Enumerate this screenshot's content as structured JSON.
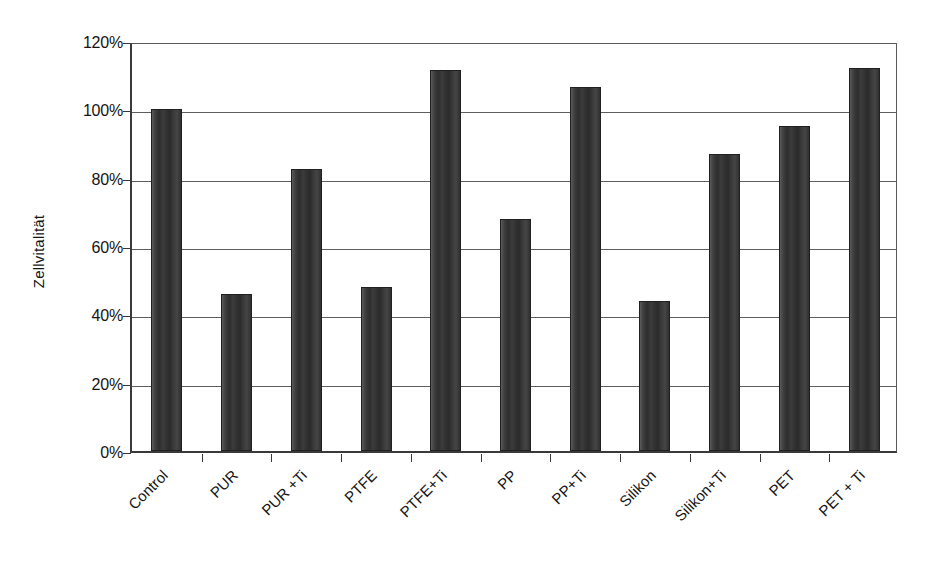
{
  "chart": {
    "type": "bar",
    "ylabel": "Zellvitalität",
    "xlabel": "",
    "title": ""
  },
  "axis": {
    "y_ticks": [
      "0%",
      "20%",
      "40%",
      "60%",
      "80%",
      "100%",
      "120%"
    ],
    "y_min": 0,
    "y_max": 120,
    "y_step": 20
  },
  "chart_data": {
    "type": "bar",
    "title": "",
    "xlabel": "",
    "ylabel": "Zellvitalität",
    "ylim": [
      0,
      120
    ],
    "ytick_labels": [
      "0%",
      "20%",
      "40%",
      "60%",
      "80%",
      "100%",
      "120%"
    ],
    "ytick_values": [
      0,
      20,
      40,
      60,
      80,
      100,
      120
    ],
    "grid": "horizontal",
    "legend": "none",
    "value_unit": "%",
    "categories": [
      "Control",
      "PUR",
      "PUR +Ti",
      "PTFE",
      "PTFE+Ti",
      "PP",
      "PP+Ti",
      "Silikon",
      "Silikon+Ti",
      "PET",
      "PET + Ti"
    ],
    "values": [
      100,
      46,
      82.5,
      48,
      111.5,
      68,
      106.5,
      44,
      87,
      95,
      112
    ],
    "series": [
      {
        "name": "Zellvitalität",
        "values": [
          100,
          46,
          82.5,
          48,
          111.5,
          68,
          106.5,
          44,
          87,
          95,
          112
        ]
      }
    ],
    "bar_color": "#333333"
  },
  "colors": {
    "bar": "#333333",
    "gridline": "#5e5e5e",
    "axis": "#3a3a3a",
    "background": "#ffffff",
    "text": "#141414"
  }
}
